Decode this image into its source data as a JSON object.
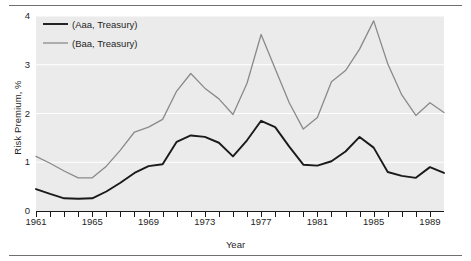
{
  "figure": {
    "separator_top": "horizontal-rule",
    "separator_bottom": "horizontal-rule"
  },
  "chart_data": {
    "type": "line",
    "title": "",
    "xlabel": "Year",
    "ylabel": "Risk Premium, %",
    "xlim": [
      1961,
      1990
    ],
    "ylim": [
      0,
      4
    ],
    "yticks": [
      0,
      1,
      2,
      3,
      4
    ],
    "xticks": [
      1961,
      1965,
      1969,
      1973,
      1977,
      1981,
      1985,
      1989
    ],
    "xtick_interval_minor": 1,
    "grid": "horizontal white gridlines at each y tick",
    "plot_background": "#ebebeb",
    "legend_position": "upper left inside axes",
    "x": [
      1961,
      1962,
      1963,
      1964,
      1965,
      1966,
      1967,
      1968,
      1969,
      1970,
      1971,
      1972,
      1973,
      1974,
      1975,
      1976,
      1977,
      1978,
      1979,
      1980,
      1981,
      1982,
      1983,
      1984,
      1985,
      1986,
      1987,
      1988,
      1989,
      1990
    ],
    "series": [
      {
        "name": "(Aaa, Treasury)",
        "color": "#1a1a1a",
        "values": [
          0.45,
          0.35,
          0.26,
          0.25,
          0.26,
          0.4,
          0.58,
          0.78,
          0.92,
          0.96,
          1.42,
          1.55,
          1.52,
          1.4,
          1.12,
          1.45,
          1.85,
          1.72,
          1.32,
          0.95,
          0.93,
          1.02,
          1.22,
          1.52,
          1.3,
          0.8,
          0.72,
          0.68,
          0.9,
          0.78
        ]
      },
      {
        "name": "(Baa, Treasury)",
        "color": "#8a8a8a",
        "values": [
          1.12,
          0.98,
          0.82,
          0.68,
          0.68,
          0.92,
          1.25,
          1.62,
          1.72,
          1.88,
          2.46,
          2.82,
          2.52,
          2.3,
          1.98,
          2.62,
          3.62,
          2.92,
          2.22,
          1.68,
          1.92,
          2.65,
          2.88,
          3.32,
          3.9,
          3.02,
          2.38,
          1.96,
          2.22,
          2.02
        ]
      }
    ],
    "annotations": []
  },
  "legend": {
    "entries": [
      {
        "label": "(Aaa, Treasury)",
        "swatch": "line-swatch-dark"
      },
      {
        "label": "(Baa, Treasury)",
        "swatch": "line-swatch-gray"
      }
    ]
  }
}
